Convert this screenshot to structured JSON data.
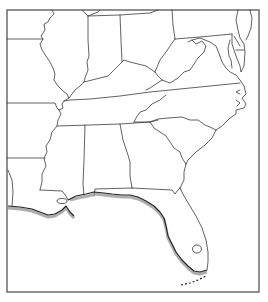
{
  "map": {
    "title": "",
    "region": "Southeastern United States",
    "type": "state outline map",
    "frame": {
      "x": 7,
      "y": 10,
      "width": 252,
      "height": 282
    },
    "colors": {
      "background": "#ffffff",
      "borders": "#3a3a3a",
      "coast_shading": "#9a9a9a"
    },
    "states_visible": [
      "Missouri",
      "Illinois",
      "Indiana",
      "Ohio",
      "Pennsylvania",
      "Maryland",
      "Delaware",
      "New Jersey",
      "West Virginia",
      "Virginia",
      "Kentucky",
      "Tennessee",
      "North Carolina",
      "South Carolina",
      "Georgia",
      "Alabama",
      "Mississippi",
      "Arkansas",
      "Louisiana",
      "Texas",
      "Florida"
    ],
    "features": [
      "Gulf coast shaded",
      "Lake Okeechobee",
      "Florida Keys (dotted)",
      "Chesapeake Bay",
      "Pamlico Sound"
    ]
  }
}
